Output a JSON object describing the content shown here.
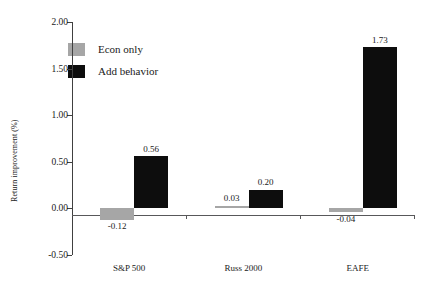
{
  "chart_data": {
    "type": "bar",
    "title": "",
    "xlabel": "",
    "ylabel": "Return improvement (%)",
    "categories": [
      "S&P 500",
      "Russ 2000",
      "EAFE"
    ],
    "series": [
      {
        "name": "Econ only",
        "color": "#a6a6a6",
        "values": [
          -0.12,
          0.03,
          -0.04
        ],
        "labels": [
          "-0.12",
          "0.03",
          "-0.04"
        ]
      },
      {
        "name": "Add behavior",
        "color": "#0d0d0d",
        "values": [
          0.56,
          0.2,
          1.73
        ],
        "labels": [
          "0.56",
          "0.20",
          "1.73"
        ]
      }
    ],
    "ylim": [
      -0.5,
      2.0
    ],
    "yticks": [
      2.0,
      1.5,
      1.0,
      0.5,
      0.0,
      -0.5
    ],
    "ytick_labels": [
      "2.00",
      "1.50",
      "1.00",
      "0.50",
      "0.00",
      "-0.50"
    ],
    "grid": false,
    "legend_position": "top-left",
    "legend": [
      "Econ only",
      "Add behavior"
    ]
  }
}
